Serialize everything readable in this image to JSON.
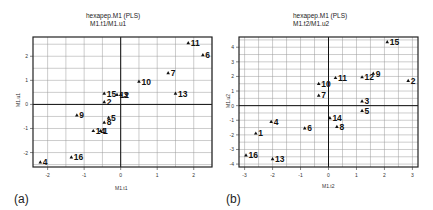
{
  "chart_data": [
    {
      "type": "scatter",
      "panel_label": "(a)",
      "title": "hexapep.M1 (PLS)",
      "subtitle": "M1.t1/M1.u1",
      "xlabel": "M1.t1",
      "ylabel": "M1.u1",
      "xlim": [
        -2.4,
        2.5
      ],
      "ylim": [
        -2.6,
        2.8
      ],
      "xticks": [
        -2,
        -1,
        0,
        1,
        2
      ],
      "yticks": [
        -2,
        -1,
        0,
        1,
        2
      ],
      "grid": true,
      "points": [
        {
          "label": "1",
          "x": -0.55,
          "y": -1.1
        },
        {
          "label": "2",
          "x": -0.45,
          "y": 0.1
        },
        {
          "label": "3",
          "x": 0.0,
          "y": 0.4
        },
        {
          "label": "4",
          "x": -2.2,
          "y": -2.4
        },
        {
          "label": "5",
          "x": -0.33,
          "y": -0.55
        },
        {
          "label": "6",
          "x": 2.25,
          "y": 2.05
        },
        {
          "label": "7",
          "x": 1.3,
          "y": 1.3
        },
        {
          "label": "8",
          "x": -0.45,
          "y": -0.75
        },
        {
          "label": "9",
          "x": -1.2,
          "y": -0.45
        },
        {
          "label": "10",
          "x": 0.5,
          "y": 0.95
        },
        {
          "label": "11",
          "x": 1.85,
          "y": 2.55
        },
        {
          "label": "12",
          "x": -0.1,
          "y": 0.4
        },
        {
          "label": "13",
          "x": 1.5,
          "y": 0.45
        },
        {
          "label": "14",
          "x": -0.75,
          "y": -1.1
        },
        {
          "label": "15",
          "x": -0.45,
          "y": 0.45
        },
        {
          "label": "16",
          "x": -1.35,
          "y": -2.2
        }
      ]
    },
    {
      "type": "scatter",
      "panel_label": "(b)",
      "title": "hexapep.M1 (PLS)",
      "subtitle": "M1.t2/M1.u2",
      "xlabel": "M1.t2",
      "ylabel": "M1.u2",
      "xlim": [
        -3.2,
        3.2
      ],
      "ylim": [
        -4.2,
        4.7
      ],
      "xticks": [
        -3,
        -2,
        -1,
        0,
        1,
        2,
        3
      ],
      "yticks": [
        -4,
        -3,
        -2,
        -1,
        0,
        1,
        2,
        3,
        4
      ],
      "grid": true,
      "points": [
        {
          "label": "1",
          "x": -2.6,
          "y": -1.9
        },
        {
          "label": "2",
          "x": 2.85,
          "y": 1.7
        },
        {
          "label": "3",
          "x": 1.2,
          "y": 0.3
        },
        {
          "label": "4",
          "x": -2.05,
          "y": -1.1
        },
        {
          "label": "5",
          "x": 1.2,
          "y": -0.35
        },
        {
          "label": "6",
          "x": -0.85,
          "y": -1.55
        },
        {
          "label": "7",
          "x": -0.35,
          "y": 0.7
        },
        {
          "label": "8",
          "x": 0.3,
          "y": -1.45
        },
        {
          "label": "9",
          "x": 1.6,
          "y": 2.2
        },
        {
          "label": "10",
          "x": -0.35,
          "y": 1.5
        },
        {
          "label": "11",
          "x": 0.25,
          "y": 1.9
        },
        {
          "label": "12",
          "x": 1.2,
          "y": 1.95
        },
        {
          "label": "13",
          "x": -2.0,
          "y": -3.65
        },
        {
          "label": "14",
          "x": 0.05,
          "y": -0.85
        },
        {
          "label": "15",
          "x": 2.1,
          "y": 4.35
        },
        {
          "label": "16",
          "x": -2.95,
          "y": -3.4
        }
      ]
    }
  ],
  "panels": [
    {
      "title": "hexapep.M1 (PLS)",
      "subtitle": "M1.t1/M1.u1",
      "xlabel": "M1.t1",
      "ylabel": "M1.u1",
      "label": "(a)"
    },
    {
      "title": "hexapep.M1 (PLS)",
      "subtitle": "M1.t2/M1.u2",
      "xlabel": "M1.t2",
      "ylabel": "M1.u2",
      "label": "(b)"
    }
  ]
}
